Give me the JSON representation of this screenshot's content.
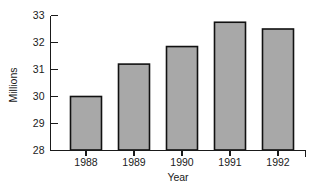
{
  "chart_data": {
    "type": "bar",
    "title": "",
    "subtitle": "",
    "categories": [
      "1988",
      "1989",
      "1990",
      "1991",
      "1992"
    ],
    "values": [
      30.0,
      31.2,
      31.85,
      32.75,
      32.5
    ],
    "xlabel": "Year",
    "ylabel": "Millions",
    "ylim": [
      28,
      33
    ],
    "ytick_labels": [
      "28",
      "29",
      "30",
      "31",
      "32",
      "33"
    ],
    "ytick_values": [
      28,
      29,
      30,
      31,
      32,
      33
    ],
    "grid": false,
    "legend": false,
    "legend_position": "none",
    "bar_fill_color": "#a8a8a8",
    "bar_border_color": "#111111",
    "axis_color": "#1a1a1a",
    "background_color": "#ffffff"
  },
  "axis": {
    "y_title": "Millions",
    "x_title": "Year"
  }
}
